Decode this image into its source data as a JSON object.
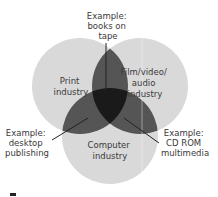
{
  "diagram": {
    "type": "venn",
    "circles": [
      {
        "id": "print",
        "label_lines": [
          "Print",
          "industry"
        ]
      },
      {
        "id": "film",
        "label_lines": [
          "Film/video/",
          "audio",
          "industry"
        ]
      },
      {
        "id": "computer",
        "label_lines": [
          "Computer",
          "industry"
        ]
      }
    ],
    "callouts": [
      {
        "id": "books-on-tape",
        "lines": [
          "Example:",
          "books on",
          "tape"
        ]
      },
      {
        "id": "desktop-publishing",
        "lines": [
          "Example:",
          "desktop",
          "publishing"
        ]
      },
      {
        "id": "cd-rom-multimedia",
        "lines": [
          "Example:",
          "CD ROM",
          "multimedia"
        ]
      }
    ],
    "colors": {
      "circle": "#d9d9d9",
      "pair_overlap": "#555555",
      "triple_overlap": "#1a1a1a",
      "text": "#3a3a3a",
      "leader_line": "#222222"
    }
  }
}
